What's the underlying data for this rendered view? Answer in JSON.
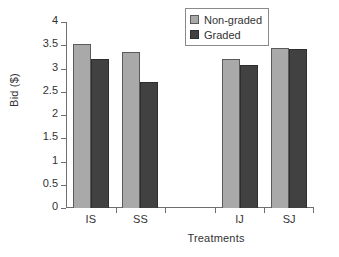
{
  "chart_data": {
    "type": "bar",
    "title": "",
    "subtitle": "",
    "xlabel": "Treatments",
    "ylabel": "Bid ($)",
    "categories": [
      "IS",
      "SS",
      "",
      "IJ",
      "SJ"
    ],
    "series": [
      {
        "name": "Non-graded",
        "color": "#a9a9a9",
        "values": [
          3.53,
          3.35,
          null,
          3.2,
          3.44
        ]
      },
      {
        "name": "Graded",
        "color": "#414141",
        "values": [
          3.2,
          2.7,
          null,
          3.07,
          3.41
        ]
      }
    ],
    "ylim": [
      0,
      4
    ],
    "ytick_labels": [
      "4",
      "3.5",
      "3",
      "2.5",
      "2",
      "1.5",
      "1",
      "0.5",
      "0"
    ],
    "ytick_values": [
      4,
      3.5,
      3,
      2.5,
      2,
      1.5,
      1,
      0.5,
      0
    ],
    "ystep": 0.5,
    "grid": false,
    "legend_position": "top-right",
    "legend_entries": [
      "Non-graded",
      "Graded"
    ]
  },
  "axes": {
    "y_title": "Bid ($)",
    "x_title": "Treatments"
  }
}
